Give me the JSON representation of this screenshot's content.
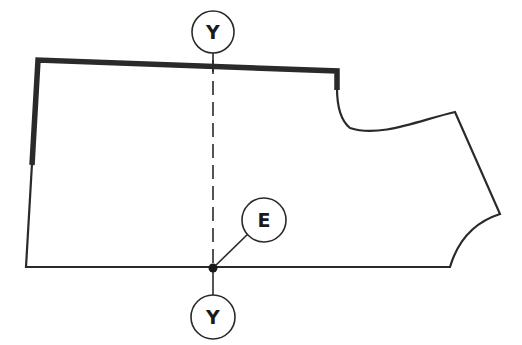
{
  "diagram": {
    "type": "garment-pattern-piece",
    "labels": {
      "top_marker": "Y",
      "point_marker": "E",
      "bottom_marker": "Y"
    },
    "colors": {
      "line": "#2a2a2a",
      "background": "#ffffff"
    }
  }
}
